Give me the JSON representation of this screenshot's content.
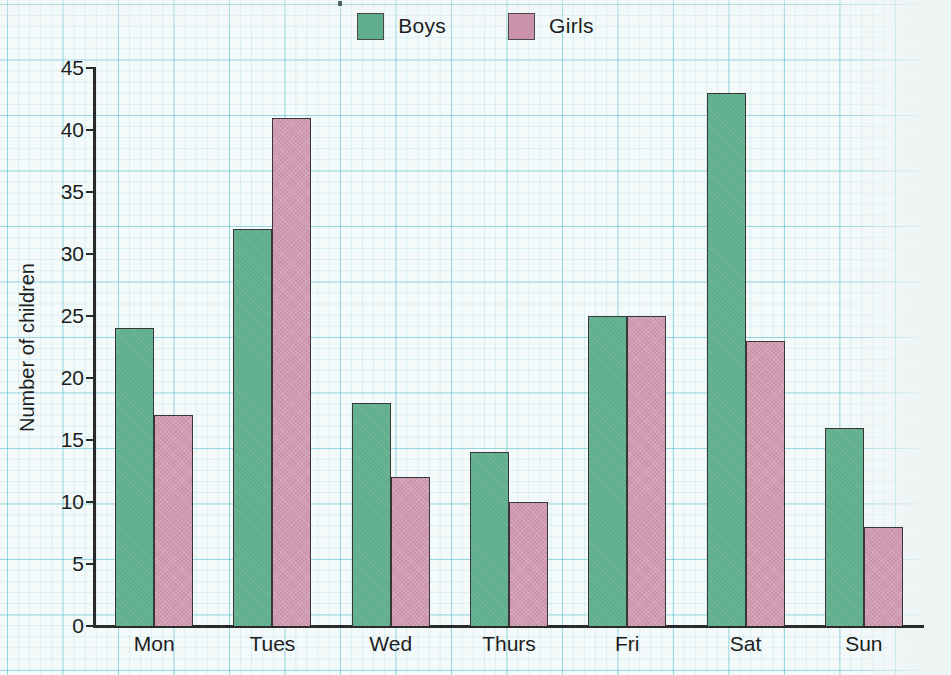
{
  "chart_data": {
    "type": "bar",
    "title": "",
    "xlabel": "",
    "ylabel": "Number of children",
    "categories": [
      "Mon",
      "Tues",
      "Wed",
      "Thurs",
      "Fri",
      "Sat",
      "Sun"
    ],
    "series": [
      {
        "name": "Boys",
        "color": "#5fae8d",
        "values": [
          24,
          32,
          18,
          14,
          25,
          43,
          16
        ]
      },
      {
        "name": "Girls",
        "color": "#cb93aa",
        "values": [
          17,
          41,
          12,
          10,
          25,
          23,
          8
        ]
      }
    ],
    "ylim": [
      0,
      45
    ],
    "ytick_step": 5,
    "yticks": [
      0,
      5,
      10,
      15,
      20,
      25,
      30,
      35,
      40,
      45
    ],
    "ytick_labels": [
      "0",
      "5",
      "10",
      "15",
      "20",
      "25",
      "30",
      "35",
      "40",
      "45"
    ],
    "grid": true,
    "grid_color": "#5abecd",
    "legend_position": "top-center",
    "background": "#f4fafa",
    "axis_color": "#2a2a2a",
    "bar_outline_color": "#3a3538"
  },
  "legend": {
    "entries": [
      {
        "label": "Boys",
        "swatch": "#5fae8d",
        "swatch_icon": "legend-swatch-icon"
      },
      {
        "label": "Girls",
        "swatch": "#cb93aa",
        "swatch_icon": "legend-swatch-icon"
      }
    ]
  },
  "axes": {
    "y_title": "Number of children",
    "y_tick_labels": [
      "45",
      "40",
      "35",
      "30",
      "25",
      "20",
      "15",
      "10",
      "5",
      "0"
    ],
    "x_tick_labels": [
      "Mon",
      "Tues",
      "Wed",
      "Thurs",
      "Fri",
      "Sat",
      "Sun"
    ]
  }
}
